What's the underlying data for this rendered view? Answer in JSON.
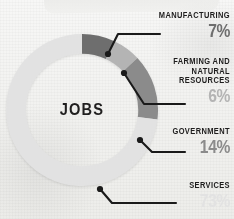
{
  "title": "JOBS",
  "center_label": "JOBS",
  "colors": {
    "manufacturing": "#6e6e6e",
    "farming": "#b4b4b4",
    "government": "#8b8b8b",
    "services": "#e2e2e2",
    "text_dark": "#1e1d1d",
    "background": "#f4f4f2",
    "leader_line": "#1a1a1a"
  },
  "callouts": {
    "manufacturing": {
      "name": "MANUFACTURING",
      "percent": "7%"
    },
    "farming": {
      "name_line1": "FARMING AND",
      "name_line2": "NATURAL",
      "name_line3": "RESOURCES",
      "percent": "6%"
    },
    "government": {
      "name": "GOVERNMENT",
      "percent": "14%"
    },
    "services": {
      "name": "SERVICES",
      "percent": "73%"
    }
  },
  "chart_data": {
    "type": "pie",
    "variant": "donut",
    "title": "JOBS",
    "xlabel": "",
    "ylabel": "",
    "units": "percent",
    "total": 100,
    "start_angle_deg": 0,
    "direction": "clockwise",
    "inner_radius_ratio": 0.74,
    "legend": "callout-labels-right",
    "grid": false,
    "categories": [
      "Manufacturing",
      "Farming and Natural Resources",
      "Government",
      "Services"
    ],
    "values": [
      7,
      6,
      14,
      73
    ],
    "labels": [
      "7%",
      "6%",
      "14%",
      "73%"
    ],
    "colors": [
      "#6e6e6e",
      "#b4b4b4",
      "#8b8b8b",
      "#e2e2e2"
    ],
    "slices": [
      {
        "name": "Manufacturing",
        "value": 7,
        "label": "7%",
        "color": "#6e6e6e"
      },
      {
        "name": "Farming and Natural Resources",
        "value": 6,
        "label": "6%",
        "color": "#b4b4b4"
      },
      {
        "name": "Government",
        "value": 14,
        "label": "14%",
        "color": "#8b8b8b"
      },
      {
        "name": "Services",
        "value": 73,
        "label": "73%",
        "color": "#e2e2e2"
      }
    ]
  }
}
